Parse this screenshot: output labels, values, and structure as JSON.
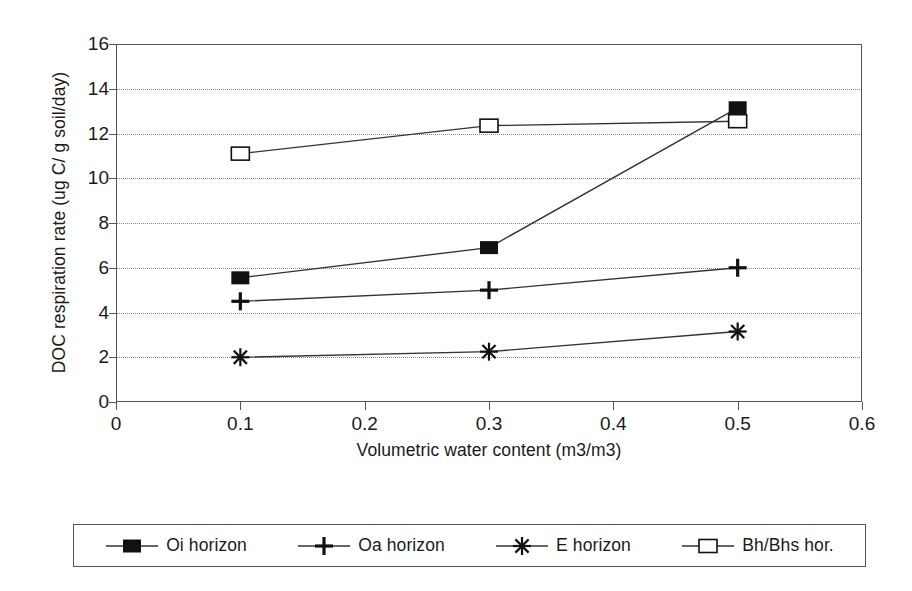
{
  "chart_data": {
    "type": "line",
    "title": "",
    "xlabel": "Volumetric water content (m3/m3)",
    "ylabel": "DOC respiration rate (ug C/ g soil/day)",
    "x": [
      0.1,
      0.3,
      0.5
    ],
    "xlim": [
      0,
      0.6
    ],
    "ylim": [
      0,
      16
    ],
    "xticks": [
      0,
      0.1,
      0.2,
      0.3,
      0.4,
      0.5,
      0.6
    ],
    "xtick_labels": [
      "0",
      "0.1",
      "0.2",
      "0.3",
      "0.4",
      "0.5",
      "0.6"
    ],
    "yticks": [
      0,
      2,
      4,
      6,
      8,
      10,
      12,
      14,
      16
    ],
    "ytick_labels": [
      "0",
      "2",
      "4",
      "6",
      "8",
      "10",
      "12",
      "14",
      "16"
    ],
    "grid": "horizontal-dotted",
    "legend_position": "below-plot",
    "series": [
      {
        "name": "Oi horizon",
        "marker": "filled-square",
        "values": [
          5.55,
          6.9,
          13.15
        ]
      },
      {
        "name": "Oa horizon",
        "marker": "plus",
        "values": [
          4.5,
          5.0,
          6.0
        ]
      },
      {
        "name": "E horizon",
        "marker": "asterisk",
        "values": [
          2.0,
          2.25,
          3.15
        ]
      },
      {
        "name": "Bh/Bhs hor.",
        "marker": "open-square",
        "values": [
          11.1,
          12.35,
          12.55
        ]
      }
    ],
    "colors": {
      "line": "#333333",
      "marker": "#111111",
      "axis": "#555555",
      "grid": "#8a8a8a",
      "background": "#ffffff"
    }
  },
  "legend": {
    "items": [
      {
        "label": "Oi horizon",
        "marker": "filled-square"
      },
      {
        "label": "Oa horizon",
        "marker": "plus"
      },
      {
        "label": "E horizon",
        "marker": "asterisk"
      },
      {
        "label": "Bh/Bhs hor.",
        "marker": "open-square"
      }
    ]
  }
}
